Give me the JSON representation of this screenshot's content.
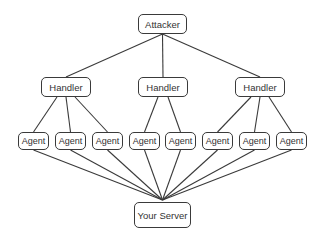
{
  "diagram": {
    "type": "hierarchy",
    "colors": {
      "stroke": "#3a3a3a",
      "text": "#333333",
      "background": "#ffffff"
    },
    "nodes": {
      "attacker": {
        "label": "Attacker",
        "x": 138,
        "y": 14,
        "w": 49,
        "h": 20
      },
      "handlers": [
        {
          "label": "Handler",
          "x": 41,
          "y": 77,
          "w": 50,
          "h": 20
        },
        {
          "label": "Handler",
          "x": 138,
          "y": 77,
          "w": 50,
          "h": 20
        },
        {
          "label": "Handler",
          "x": 235,
          "y": 77,
          "w": 50,
          "h": 20
        }
      ],
      "agents": [
        {
          "label": "Agent",
          "x": 18,
          "y": 132,
          "w": 31,
          "h": 18,
          "handler": 0
        },
        {
          "label": "Agent",
          "x": 55,
          "y": 132,
          "w": 31,
          "h": 18,
          "handler": 0
        },
        {
          "label": "Agent",
          "x": 92,
          "y": 132,
          "w": 31,
          "h": 18,
          "handler": 0
        },
        {
          "label": "Agent",
          "x": 129,
          "y": 132,
          "w": 31,
          "h": 18,
          "handler": 1
        },
        {
          "label": "Agent",
          "x": 165,
          "y": 132,
          "w": 31,
          "h": 18,
          "handler": 1
        },
        {
          "label": "Agent",
          "x": 202,
          "y": 132,
          "w": 31,
          "h": 18,
          "handler": 2
        },
        {
          "label": "Agent",
          "x": 239,
          "y": 132,
          "w": 31,
          "h": 18,
          "handler": 2
        },
        {
          "label": "Agent",
          "x": 276,
          "y": 132,
          "w": 31,
          "h": 18,
          "handler": 2
        }
      ],
      "server": {
        "label": "Your Server",
        "x": 134,
        "y": 202,
        "w": 57,
        "h": 26
      }
    }
  }
}
